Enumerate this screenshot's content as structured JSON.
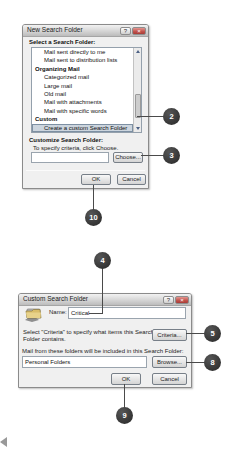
{
  "dialog1": {
    "title": "New Search Folder",
    "help_icon": "?",
    "close_icon": "×",
    "select_label": "Select a Search Folder:",
    "items": [
      "Mail sent directly to me",
      "Mail sent to distribution lists",
      "Organizing Mail",
      "Categorized mail",
      "Large mail",
      "Old mail",
      "Mail with attachments",
      "Mail with specific words",
      "Custom",
      "Create a custom Search Folder"
    ],
    "selected_item": "Create a custom Search Folder",
    "customize_label": "Customize Search Folder:",
    "criteria_hint": "To specify criteria, click Choose.",
    "criteria_value": "",
    "choose_button": "Choose...",
    "ok_button": "OK",
    "cancel_button": "Cancel"
  },
  "dialog2": {
    "title": "Custom Search Folder",
    "help_icon": "?",
    "close_icon": "×",
    "name_label": "Name:",
    "name_value": "Critical",
    "criteria_text_line1": "Select \"Criteria\" to specify what items this Search",
    "criteria_text_line2": "Folder contains.",
    "criteria_button": "Criteria...",
    "folders_label": "Mail from these folders will be included in this Search Folder:",
    "folders_value": "Personal Folders",
    "browse_button": "Browse...",
    "ok_button": "OK",
    "cancel_button": "Cancel"
  },
  "callouts": {
    "step2": "2",
    "step3": "3",
    "step4": "4",
    "step5": "5",
    "step8": "8",
    "step9": "9",
    "step10": "10"
  },
  "colors": {
    "callout_bg": "#3a3a3a",
    "selection_bg": "#ccd5de",
    "close_button": "#c0504a",
    "dialog_bg": "#f0f0f0"
  }
}
